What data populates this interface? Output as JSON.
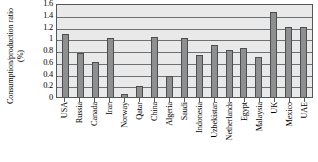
{
  "chart_data": {
    "type": "bar",
    "title": "",
    "xlabel": "",
    "ylabel": "Consumption/production ratio (%)",
    "ylim": [
      0,
      1.6
    ],
    "ytick_labels": [
      "0",
      "0.2",
      "0.4",
      "0.6",
      "0.8",
      "1",
      "1.2",
      "1.4",
      "1.6"
    ],
    "yticks": [
      0,
      0.2,
      0.4,
      0.6,
      0.8,
      1,
      1.2,
      1.4,
      1.6
    ],
    "grid": true,
    "legend": "none",
    "categories": [
      "USA",
      "Russia",
      "Canada",
      "Iran",
      "Norway",
      "Qatar",
      "China",
      "Algeria",
      "Saudi",
      "Indonesia",
      "Uzbekistan",
      "Netherlands",
      "Egypt",
      "Malaysia",
      "UK",
      "Mexico",
      "UAE"
    ],
    "values": [
      1.08,
      0.75,
      0.59,
      1.0,
      0.05,
      0.18,
      1.02,
      0.35,
      1.0,
      0.72,
      0.88,
      0.8,
      0.84,
      0.68,
      1.45,
      1.2,
      1.2
    ],
    "bar_color": "#8f8f8f",
    "bar_edge_color": "#4c4f51",
    "plot_background": "#e9e9e9",
    "gridline_color": "#6e7173",
    "axis_color": "#55585a"
  }
}
